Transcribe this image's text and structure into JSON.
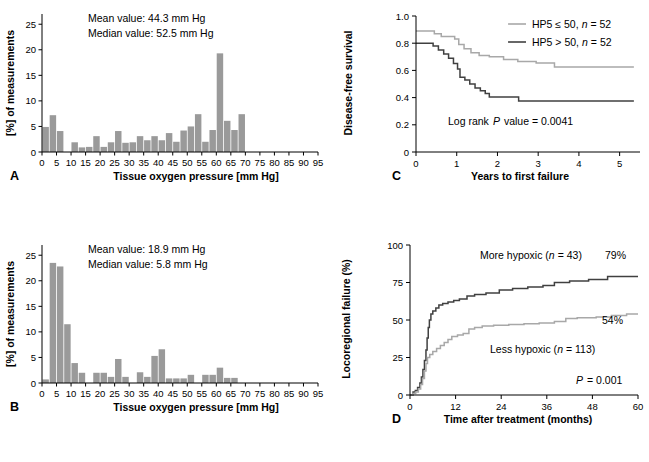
{
  "figure": {
    "panels": [
      "A",
      "B",
      "C",
      "D"
    ],
    "bar_color": "#9a9a9a",
    "line_dark": "#404040",
    "line_light": "#a8a8a8",
    "axis_color": "#000000"
  },
  "panelA": {
    "letter": "A",
    "annotation_mean": "Mean value: 44.3 mm Hg",
    "annotation_median": "Median value: 52.5 mm Hg",
    "chart_data": {
      "type": "bar",
      "title": "",
      "xlabel": "Tissue oxygen pressure [mm Hg]",
      "ylabel": "[%] of measurements",
      "xlim": [
        0,
        95
      ],
      "ylim": [
        0,
        27
      ],
      "xticks": [
        0,
        5,
        10,
        15,
        20,
        25,
        30,
        35,
        40,
        45,
        50,
        55,
        60,
        65,
        70,
        75,
        80,
        85,
        90,
        95
      ],
      "yticks": [
        0,
        5,
        10,
        15,
        20,
        25
      ],
      "bin_width": 2.5,
      "grid": false,
      "mean": 44.3,
      "median": 52.5,
      "bin_starts": [
        0,
        2.5,
        5,
        7.5,
        10,
        12.5,
        15,
        17.5,
        20,
        22.5,
        25,
        27.5,
        30,
        32.5,
        35,
        37.5,
        40,
        42.5,
        45,
        47.5,
        50,
        52.5,
        55,
        57.5,
        60,
        62.5,
        65,
        67.5
      ],
      "values": [
        4.9,
        7.2,
        4.1,
        0,
        1.9,
        0.9,
        1.0,
        3.1,
        1.0,
        1.9,
        4.1,
        1.8,
        1.9,
        3.1,
        2.3,
        3.1,
        2.3,
        3.7,
        2.0,
        4.2,
        5.0,
        7.4,
        2.0,
        4.3,
        19.3,
        6.1,
        4.3,
        7.4
      ]
    }
  },
  "panelB": {
    "letter": "B",
    "annotation_mean": "Mean value: 18.9 mm Hg",
    "annotation_median": "Median value: 5.8 mm Hg",
    "chart_data": {
      "type": "bar",
      "title": "",
      "xlabel": "Tissue oxygen pressure [mm Hg]",
      "ylabel": "[%] of measurements",
      "xlim": [
        0,
        95
      ],
      "ylim": [
        0,
        27
      ],
      "xticks": [
        0,
        5,
        10,
        15,
        20,
        25,
        30,
        35,
        40,
        45,
        50,
        55,
        60,
        65,
        70,
        75,
        80,
        85,
        90,
        95
      ],
      "yticks": [
        0,
        5,
        10,
        15,
        20,
        25
      ],
      "bin_width": 2.5,
      "grid": false,
      "mean": 18.9,
      "median": 5.8,
      "bin_starts": [
        0,
        2.5,
        5,
        7.5,
        10,
        12.5,
        15,
        17.5,
        20,
        22.5,
        25,
        27.5,
        30,
        32.5,
        35,
        37.5,
        40,
        42.5,
        45,
        47.5,
        50,
        52.5,
        55,
        57.5,
        60,
        62.5,
        65
      ],
      "values": [
        0.7,
        23.5,
        22.8,
        11.5,
        3.9,
        2.0,
        0,
        2.0,
        2.0,
        1.2,
        4.7,
        1.2,
        0,
        2.1,
        1.2,
        5.3,
        6.6,
        0.9,
        0.9,
        0.9,
        1.6,
        0,
        1.6,
        1.6,
        3.0,
        1.0,
        1.0
      ]
    }
  },
  "panelC": {
    "letter": "C",
    "annotation_logrank": "Log rank",
    "annotation_logrank_p": "P",
    "annotation_logrank_value": "value = 0.0041",
    "chart_data": {
      "type": "line",
      "title": "",
      "xlabel": "Years to first failure",
      "ylabel": "Disease-free survival",
      "xlim": [
        0,
        5.5
      ],
      "ylim": [
        0,
        1.0
      ],
      "xticks": [
        0,
        1,
        2,
        3,
        4,
        5
      ],
      "yticks": [
        0,
        0.2,
        0.4,
        0.6,
        0.8,
        1.0
      ],
      "grid": false,
      "legend_position": "top-right",
      "series": [
        {
          "name": "HP5 ≤ 50, n = 52",
          "name_prefix": "HP5 ≤ 50,",
          "name_italic": "n",
          "name_suffix": "= 52",
          "color": "#a8a8a8",
          "final_value": 0.62,
          "points": [
            [
              0,
              0.89
            ],
            [
              0.45,
              0.89
            ],
            [
              0.45,
              0.87
            ],
            [
              0.62,
              0.87
            ],
            [
              0.62,
              0.85
            ],
            [
              0.95,
              0.85
            ],
            [
              0.95,
              0.83
            ],
            [
              1.05,
              0.83
            ],
            [
              1.05,
              0.79
            ],
            [
              1.18,
              0.79
            ],
            [
              1.18,
              0.76
            ],
            [
              1.35,
              0.76
            ],
            [
              1.35,
              0.73
            ],
            [
              1.55,
              0.73
            ],
            [
              1.55,
              0.71
            ],
            [
              1.8,
              0.71
            ],
            [
              1.8,
              0.7
            ],
            [
              2.15,
              0.7
            ],
            [
              2.15,
              0.68
            ],
            [
              2.5,
              0.68
            ],
            [
              2.5,
              0.665
            ],
            [
              2.95,
              0.665
            ],
            [
              2.95,
              0.655
            ],
            [
              3.4,
              0.655
            ],
            [
              3.4,
              0.625
            ],
            [
              5.35,
              0.625
            ]
          ]
        },
        {
          "name": "HP5 > 50, n = 52",
          "name_prefix": "HP5 > 50,",
          "name_italic": "n",
          "name_suffix": "= 52",
          "color": "#404040",
          "final_value": 0.37,
          "points": [
            [
              0,
              0.8
            ],
            [
              0.42,
              0.8
            ],
            [
              0.42,
              0.78
            ],
            [
              0.55,
              0.78
            ],
            [
              0.55,
              0.75
            ],
            [
              0.68,
              0.75
            ],
            [
              0.68,
              0.72
            ],
            [
              0.8,
              0.72
            ],
            [
              0.8,
              0.69
            ],
            [
              0.92,
              0.69
            ],
            [
              0.92,
              0.65
            ],
            [
              1.02,
              0.65
            ],
            [
              1.02,
              0.61
            ],
            [
              1.08,
              0.61
            ],
            [
              1.08,
              0.55
            ],
            [
              1.2,
              0.55
            ],
            [
              1.2,
              0.53
            ],
            [
              1.32,
              0.53
            ],
            [
              1.32,
              0.5
            ],
            [
              1.45,
              0.5
            ],
            [
              1.45,
              0.47
            ],
            [
              1.58,
              0.47
            ],
            [
              1.58,
              0.45
            ],
            [
              1.7,
              0.45
            ],
            [
              1.7,
              0.43
            ],
            [
              1.8,
              0.43
            ],
            [
              1.8,
              0.405
            ],
            [
              2.52,
              0.405
            ],
            [
              2.52,
              0.375
            ],
            [
              5.35,
              0.375
            ]
          ]
        }
      ]
    }
  },
  "panelD": {
    "letter": "D",
    "annotation_p_italic": "P",
    "annotation_p_value": "= 0.001",
    "chart_data": {
      "type": "line",
      "title": "",
      "xlabel": "Time after treatment (months)",
      "ylabel": "Locoregional failure (%)",
      "xlim": [
        0,
        60
      ],
      "ylim": [
        0,
        100
      ],
      "xticks": [
        0,
        12,
        24,
        36,
        48,
        60
      ],
      "yticks": [
        0,
        25,
        50,
        75,
        100
      ],
      "grid": false,
      "series": [
        {
          "name": "More hypoxic (n = 43)",
          "name_prefix": "More hypoxic (",
          "name_italic": "n",
          "name_suffix": "= 43)",
          "endpoint_label": "79%",
          "color": "#404040",
          "final_value": 79,
          "points": [
            [
              0,
              0
            ],
            [
              0.8,
              0
            ],
            [
              0.8,
              2
            ],
            [
              1.4,
              2
            ],
            [
              1.4,
              3
            ],
            [
              2.0,
              3
            ],
            [
              2.0,
              5
            ],
            [
              2.6,
              5
            ],
            [
              2.6,
              8
            ],
            [
              3.0,
              8
            ],
            [
              3.0,
              12
            ],
            [
              3.4,
              12
            ],
            [
              3.4,
              17
            ],
            [
              3.8,
              17
            ],
            [
              3.8,
              23
            ],
            [
              4.2,
              23
            ],
            [
              4.2,
              30
            ],
            [
              4.5,
              30
            ],
            [
              4.5,
              38
            ],
            [
              4.8,
              38
            ],
            [
              4.8,
              45
            ],
            [
              5.1,
              45
            ],
            [
              5.1,
              50
            ],
            [
              5.5,
              50
            ],
            [
              5.5,
              54
            ],
            [
              6.0,
              54
            ],
            [
              6.0,
              56
            ],
            [
              6.8,
              56
            ],
            [
              6.8,
              58
            ],
            [
              7.6,
              58
            ],
            [
              7.6,
              60
            ],
            [
              8.6,
              60
            ],
            [
              8.6,
              61
            ],
            [
              10.0,
              61
            ],
            [
              10.0,
              62
            ],
            [
              11.5,
              62
            ],
            [
              11.5,
              63
            ],
            [
              13.0,
              63
            ],
            [
              13.0,
              64
            ],
            [
              15.0,
              64
            ],
            [
              15.0,
              66
            ],
            [
              17.0,
              66
            ],
            [
              17.0,
              67
            ],
            [
              20.0,
              67
            ],
            [
              20.0,
              68
            ],
            [
              23.5,
              68
            ],
            [
              23.5,
              70
            ],
            [
              27.0,
              70
            ],
            [
              27.0,
              71
            ],
            [
              31.0,
              71
            ],
            [
              31.0,
              72
            ],
            [
              35.0,
              72
            ],
            [
              35.0,
              73
            ],
            [
              38.0,
              73
            ],
            [
              38.0,
              75
            ],
            [
              42.0,
              75
            ],
            [
              42.0,
              76
            ],
            [
              47.0,
              76
            ],
            [
              47.0,
              77
            ],
            [
              52.0,
              77
            ],
            [
              52.0,
              79
            ],
            [
              60,
              79
            ]
          ]
        },
        {
          "name": "Less hypoxic (n = 113)",
          "name_prefix": "Less hypoxic (",
          "name_italic": "n",
          "name_suffix": "= 113)",
          "endpoint_label": "54%",
          "color": "#a8a8a8",
          "final_value": 54,
          "points": [
            [
              0,
              0
            ],
            [
              0.8,
              0
            ],
            [
              0.8,
              1
            ],
            [
              1.5,
              1
            ],
            [
              1.5,
              2
            ],
            [
              2.2,
              2
            ],
            [
              2.2,
              4
            ],
            [
              2.8,
              4
            ],
            [
              2.8,
              7
            ],
            [
              3.3,
              7
            ],
            [
              3.3,
              11
            ],
            [
              3.8,
              11
            ],
            [
              3.8,
              16
            ],
            [
              4.2,
              16
            ],
            [
              4.2,
              21
            ],
            [
              4.6,
              21
            ],
            [
              4.6,
              25
            ],
            [
              5.2,
              25
            ],
            [
              5.2,
              27
            ],
            [
              6.0,
              27
            ],
            [
              6.0,
              29
            ],
            [
              7.0,
              29
            ],
            [
              7.0,
              31
            ],
            [
              8.0,
              31
            ],
            [
              8.0,
              33
            ],
            [
              9.0,
              33
            ],
            [
              9.0,
              35
            ],
            [
              10.0,
              35
            ],
            [
              10.0,
              37
            ],
            [
              11.0,
              37
            ],
            [
              11.0,
              39
            ],
            [
              12.5,
              39
            ],
            [
              12.5,
              40
            ],
            [
              14.0,
              40
            ],
            [
              14.0,
              41
            ],
            [
              15.5,
              41
            ],
            [
              15.5,
              44
            ],
            [
              17.0,
              44
            ],
            [
              17.0,
              45
            ],
            [
              19.0,
              45
            ],
            [
              19.0,
              46
            ],
            [
              22.0,
              46
            ],
            [
              22.0,
              46.5
            ],
            [
              26.0,
              46.5
            ],
            [
              26.0,
              47
            ],
            [
              30.0,
              47
            ],
            [
              30.0,
              47.5
            ],
            [
              34.0,
              47.5
            ],
            [
              34.0,
              48
            ],
            [
              38.0,
              48
            ],
            [
              38.0,
              49
            ],
            [
              41.0,
              49
            ],
            [
              41.0,
              51
            ],
            [
              44.0,
              51
            ],
            [
              44.0,
              51.5
            ],
            [
              49.0,
              51.5
            ],
            [
              49.0,
              52
            ],
            [
              53.0,
              52
            ],
            [
              53.0,
              53
            ],
            [
              57.0,
              53
            ],
            [
              57.0,
              54
            ],
            [
              60,
              54
            ]
          ]
        }
      ]
    }
  }
}
